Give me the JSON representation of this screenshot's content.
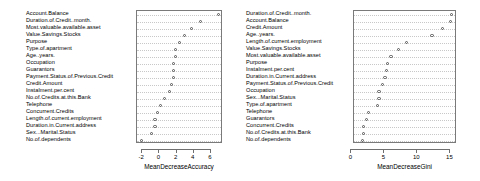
{
  "chart_data": [
    {
      "type": "scatter",
      "panel_id": "MeanDecreaseAccuracy",
      "title": "",
      "xlabel": "MeanDecreaseAccuracy",
      "ylabel": "",
      "xlim": [
        -2.6,
        7.4
      ],
      "xticks": [
        -2,
        0,
        2,
        4,
        6
      ],
      "xticklabels": [
        "-2",
        "0",
        "2",
        "4",
        "6"
      ],
      "grid": true,
      "grid_orientation": "horizontal",
      "legend": "none",
      "categories": [
        "Account.Balance",
        "Duration.of.Credit..month.",
        "Most.valuable.available.asset",
        "Value.Savings.Stocks",
        "Purpose",
        "Type.of.apartment",
        "Age..years.",
        "Occupation",
        "Guarantors",
        "Payment.Status.of.Previous.Credit",
        "Credit.Amount",
        "Instalment.per.cent",
        "No.of.Credits.at.this.Bank",
        "Telephone",
        "Concurrent.Credits",
        "Length.of.current.employment",
        "Duration.in.Current.address",
        "Sex...Marital.Status",
        "No.of.dependents"
      ],
      "values": [
        6.9,
        4.8,
        3.7,
        2.9,
        2.3,
        1.9,
        1.9,
        1.6,
        1.6,
        1.6,
        1.4,
        1.2,
        0.6,
        0.1,
        -0.2,
        -0.5,
        -0.5,
        -0.9,
        -2.1
      ]
    },
    {
      "type": "scatter",
      "panel_id": "MeanDecreaseGini",
      "title": "",
      "xlabel": "MeanDecreaseGini",
      "ylabel": "",
      "xlim": [
        0.4,
        16.0
      ],
      "xticks": [
        0,
        5,
        10,
        15
      ],
      "xticklabels": [
        "0",
        "5",
        "10",
        "15"
      ],
      "grid": true,
      "grid_orientation": "horizontal",
      "legend": "none",
      "categories": [
        "Duration.of.Credit..month.",
        "Account.Balance",
        "Credit.Amount",
        "Age..years.",
        "Length.of.current.employment",
        "Value.Savings.Stocks",
        "Most.valuable.available.asset",
        "Purpose",
        "Instalment.per.cent",
        "Duration.in.Current.address",
        "Payment.Status.of.Previous.Credit",
        "Occupation",
        "Sex...Marital.Status",
        "Type.of.apartment",
        "Telephone",
        "Guarantors",
        "Concurrent.Credits",
        "No.of.Credits.at.this.Bank",
        "No.of.dependents"
      ],
      "values": [
        15.2,
        15.0,
        13.8,
        12.2,
        8.4,
        7.1,
        6.0,
        5.5,
        5.3,
        5.1,
        4.7,
        4.2,
        4.2,
        4.0,
        2.6,
        2.3,
        1.9,
        1.8,
        1.7
      ]
    }
  ]
}
